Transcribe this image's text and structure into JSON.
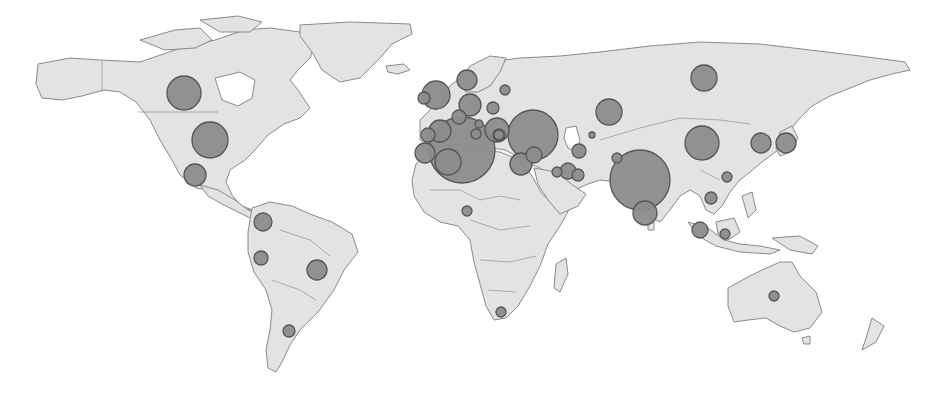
{
  "map": {
    "type": "proportional-symbol world map",
    "colors": {
      "background": "#ffffff",
      "land": "#e3e3e3",
      "land_outline": "#8a8a8a",
      "bubble_fill": "#8c8c8c",
      "bubble_stroke": "#555555"
    }
  },
  "chart_data": {
    "type": "scatter",
    "title": "",
    "points": [
      {
        "region": "Canada",
        "x": 184,
        "y": 93,
        "r": 17
      },
      {
        "region": "United States",
        "x": 210,
        "y": 140,
        "r": 18
      },
      {
        "region": "Mexico",
        "x": 195,
        "y": 175,
        "r": 11
      },
      {
        "region": "Colombia",
        "x": 263,
        "y": 222,
        "r": 9
      },
      {
        "region": "Peru",
        "x": 261,
        "y": 258,
        "r": 7
      },
      {
        "region": "Brazil",
        "x": 317,
        "y": 270,
        "r": 10
      },
      {
        "region": "Argentina",
        "x": 289,
        "y": 331,
        "r": 6
      },
      {
        "region": "United Kingdom",
        "x": 436,
        "y": 95,
        "r": 14
      },
      {
        "region": "Ireland",
        "x": 424,
        "y": 98,
        "r": 6
      },
      {
        "region": "Norway",
        "x": 467,
        "y": 80,
        "r": 10
      },
      {
        "region": "Finland/Russia NW",
        "x": 505,
        "y": 90,
        "r": 5
      },
      {
        "region": "Germany",
        "x": 470,
        "y": 105,
        "r": 11
      },
      {
        "region": "Netherlands",
        "x": 459,
        "y": 117,
        "r": 7
      },
      {
        "region": "Poland",
        "x": 493,
        "y": 108,
        "r": 6
      },
      {
        "region": "Czechia",
        "x": 479,
        "y": 124,
        "r": 4
      },
      {
        "region": "Austria",
        "x": 476,
        "y": 134,
        "r": 5
      },
      {
        "region": "France",
        "x": 440,
        "y": 131,
        "r": 11
      },
      {
        "region": "Spain",
        "x": 428,
        "y": 135,
        "r": 7
      },
      {
        "region": "Portugal",
        "x": 425,
        "y": 153,
        "r": 10
      },
      {
        "region": "Algeria/Morocco",
        "x": 448,
        "y": 162,
        "r": 13
      },
      {
        "region": "North Africa / Mediterranean",
        "x": 462,
        "y": 150,
        "r": 33
      },
      {
        "region": "Italy",
        "x": 497,
        "y": 130,
        "r": 12
      },
      {
        "region": "Balkans",
        "x": 499,
        "y": 135,
        "r": 6
      },
      {
        "region": "Greece",
        "x": 499,
        "y": 135,
        "r": 5
      },
      {
        "region": "Ukraine / Russia W",
        "x": 533,
        "y": 135,
        "r": 25
      },
      {
        "region": "Turkey",
        "x": 534,
        "y": 155,
        "r": 8
      },
      {
        "region": "Egypt",
        "x": 521,
        "y": 164,
        "r": 11
      },
      {
        "region": "Iraq",
        "x": 557,
        "y": 172,
        "r": 5
      },
      {
        "region": "Iran",
        "x": 568,
        "y": 171,
        "r": 8
      },
      {
        "region": "Afghanistan",
        "x": 578,
        "y": 175,
        "r": 6
      },
      {
        "region": "Turkmenistan",
        "x": 579,
        "y": 151,
        "r": 7
      },
      {
        "region": "Uzbekistan",
        "x": 592,
        "y": 135,
        "r": 3
      },
      {
        "region": "Kazakhstan",
        "x": 609,
        "y": 112,
        "r": 13
      },
      {
        "region": "Russia (Siberia)",
        "x": 704,
        "y": 78,
        "r": 13
      },
      {
        "region": "China",
        "x": 702,
        "y": 143,
        "r": 17
      },
      {
        "region": "Pakistan",
        "x": 617,
        "y": 158,
        "r": 5
      },
      {
        "region": "India",
        "x": 640,
        "y": 180,
        "r": 30
      },
      {
        "region": "Sri Lanka",
        "x": 645,
        "y": 213,
        "r": 12
      },
      {
        "region": "South Korea",
        "x": 761,
        "y": 143,
        "r": 10
      },
      {
        "region": "Japan",
        "x": 786,
        "y": 143,
        "r": 10
      },
      {
        "region": "Vietnam",
        "x": 727,
        "y": 177,
        "r": 5
      },
      {
        "region": "Thailand/Cambodia",
        "x": 711,
        "y": 198,
        "r": 6
      },
      {
        "region": "Malaysia / Indonesia W",
        "x": 700,
        "y": 230,
        "r": 8
      },
      {
        "region": "Borneo",
        "x": 725,
        "y": 234,
        "r": 5
      },
      {
        "region": "Nigeria",
        "x": 467,
        "y": 211,
        "r": 5
      },
      {
        "region": "South Africa",
        "x": 501,
        "y": 312,
        "r": 5
      },
      {
        "region": "Australia",
        "x": 774,
        "y": 296,
        "r": 5
      }
    ],
    "legend": [],
    "xlabel": "",
    "ylabel": ""
  }
}
